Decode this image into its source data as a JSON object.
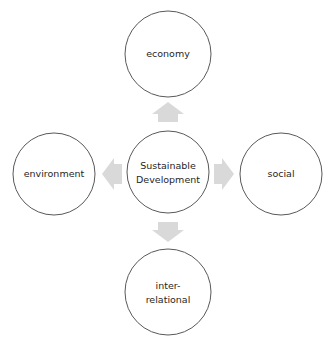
{
  "diagram": {
    "type": "hub-and-spoke",
    "center": {
      "id": "center",
      "label_lines": [
        "Sustainable",
        "Development"
      ]
    },
    "nodes": [
      {
        "id": "top",
        "position": "top",
        "label_lines": [
          "economy"
        ]
      },
      {
        "id": "left",
        "position": "left",
        "label_lines": [
          "environment"
        ]
      },
      {
        "id": "right",
        "position": "right",
        "label_lines": [
          "social"
        ]
      },
      {
        "id": "bottom",
        "position": "bottom",
        "label_lines": [
          "inter-",
          "relational"
        ]
      }
    ],
    "arrows": [
      {
        "from": "center",
        "to": "top",
        "direction": "up"
      },
      {
        "from": "center",
        "to": "left",
        "direction": "left"
      },
      {
        "from": "center",
        "to": "right",
        "direction": "right"
      },
      {
        "from": "center",
        "to": "bottom",
        "direction": "down"
      }
    ],
    "colors": {
      "circle_stroke": "#595959",
      "circle_fill": "#ffffff",
      "arrow_fill": "#d9d9d9",
      "text": "#262626"
    }
  }
}
